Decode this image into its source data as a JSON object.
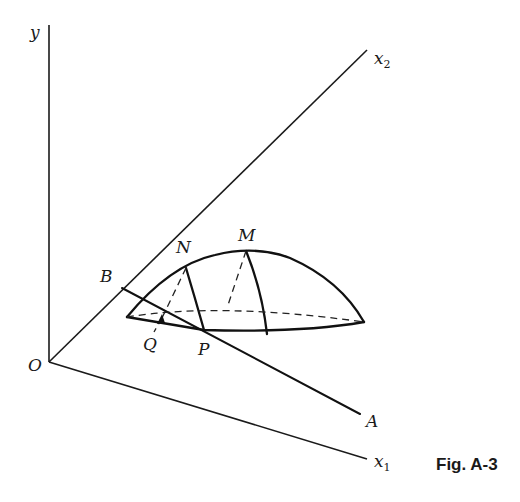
{
  "figure": {
    "caption": "Fig. A-3",
    "axes": {
      "y": "y",
      "x1": "x",
      "x1_sub": "1",
      "x2": "x",
      "x2_sub": "2",
      "origin": "O"
    },
    "points": {
      "A": "A",
      "B": "B",
      "M": "M",
      "N": "N",
      "P": "P",
      "Q": "Q"
    }
  },
  "colors": {
    "ink": "#1a1a1a",
    "background": "#ffffff"
  }
}
